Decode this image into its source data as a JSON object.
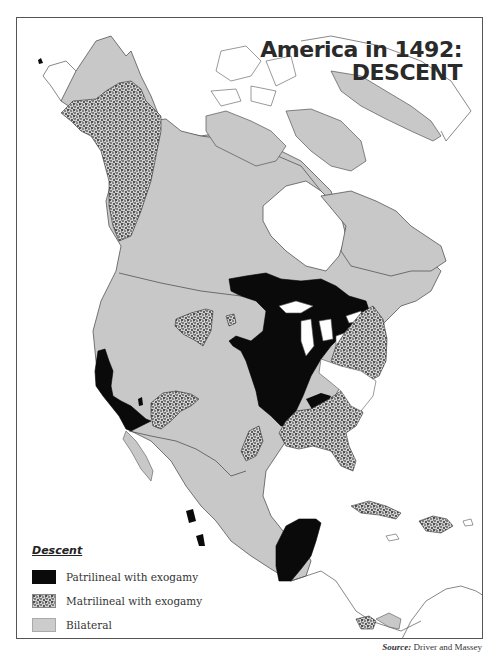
{
  "title": {
    "line1": "America in 1492:",
    "line2": "DESCENT"
  },
  "legend": {
    "title": "Descent",
    "items": [
      {
        "key": "patrilineal",
        "label": "Patrilineal with exogamy",
        "fill": "#0a0a0a",
        "pattern": "solid"
      },
      {
        "key": "matrilineal",
        "label": "Matrilineal with exogamy",
        "fill": "#c8c8c8",
        "pattern": "stipple"
      },
      {
        "key": "bilateral",
        "label": "Bilateral",
        "fill": "#cccccc",
        "pattern": "solid"
      }
    ]
  },
  "source": {
    "label": "Source:",
    "text": "Driver and Massey"
  },
  "colors": {
    "patrilineal": "#0a0a0a",
    "bilateral": "#c8c8c8",
    "water": "#ffffff",
    "outline": "#555555"
  }
}
